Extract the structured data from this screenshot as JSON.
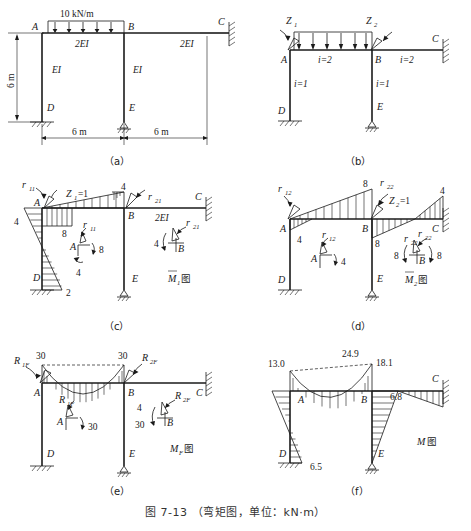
{
  "figure": {
    "caption": "图 7-13 （弯矩图，单位：kN·m）",
    "caption_number": "图 7-13",
    "caption_text": "（弯矩图，单位：kN·m）",
    "units": "kN·m"
  },
  "panels": [
    {
      "id": "a",
      "label": "（a）",
      "title": "",
      "joints": [
        "A",
        "B",
        "C",
        "D",
        "E"
      ],
      "load_label": "10 kN/m",
      "member_labels": [
        {
          "name": "AB",
          "text": "2EI"
        },
        {
          "name": "BC",
          "text": "2EI"
        },
        {
          "name": "AD",
          "text": "EI"
        },
        {
          "name": "BE",
          "text": "EI"
        }
      ],
      "dimensions": [
        {
          "name": "height-AD",
          "text": "6 m"
        },
        {
          "name": "span-AB",
          "text": "6 m"
        },
        {
          "name": "span-BC",
          "text": "6 m"
        }
      ]
    },
    {
      "id": "b",
      "label": "（b）",
      "title": "",
      "joints": [
        "A",
        "B",
        "C",
        "D",
        "E"
      ],
      "unknowns": [
        "Z",
        "Z"
      ],
      "unknown_1": "Z",
      "unknown_1_sub": "1",
      "unknown_2": "Z",
      "unknown_2_sub": "2",
      "stiffness_labels": [
        {
          "name": "AB",
          "text": "i=2"
        },
        {
          "name": "BC",
          "text": "i=2"
        },
        {
          "name": "AD",
          "text": "i=1"
        },
        {
          "name": "BE",
          "text": "i=1"
        }
      ]
    },
    {
      "id": "c",
      "label": "（c）",
      "title": "M",
      "title_sub": "1",
      "title_suffix": "图",
      "applied": "Z",
      "applied_sub": "1",
      "applied_value": "=1",
      "joints": [
        "A",
        "B",
        "C",
        "D",
        "E"
      ],
      "member_label": "2EI",
      "reactions": [
        {
          "name": "r11-top",
          "symbol": "r",
          "sub": "11"
        },
        {
          "name": "r21-top",
          "symbol": "r",
          "sub": "21"
        },
        {
          "name": "r11-fbd",
          "symbol": "r",
          "sub": "11"
        },
        {
          "name": "r21-fbd",
          "symbol": "r",
          "sub": "21"
        }
      ],
      "ordinates": [
        {
          "name": "A-left",
          "value": "4"
        },
        {
          "name": "A-right",
          "value": "4"
        },
        {
          "name": "AB-mid",
          "value": "8"
        },
        {
          "name": "B-top",
          "value": "4"
        },
        {
          "name": "D-bottom",
          "value": "2"
        }
      ],
      "fbd_A": {
        "joint": "A",
        "right": "8",
        "bottom": "4"
      },
      "fbd_B": {
        "joint": "B",
        "left": "4"
      }
    },
    {
      "id": "d",
      "label": "（d）",
      "title": "M",
      "title_sub": "2",
      "title_suffix": "图",
      "applied": "Z",
      "applied_sub": "2",
      "applied_value": "=1",
      "joints": [
        "A",
        "B",
        "C",
        "D",
        "E"
      ],
      "reactions": [
        {
          "name": "r12-top",
          "symbol": "r",
          "sub": "12"
        },
        {
          "name": "r22-top",
          "symbol": "r",
          "sub": "22"
        },
        {
          "name": "r12-fbd",
          "symbol": "r",
          "sub": "12"
        },
        {
          "name": "r22-fbd",
          "symbol": "r",
          "sub": "22"
        },
        {
          "name": "r22-span",
          "symbol": "r",
          "sub": "22"
        }
      ],
      "ordinates": [
        {
          "name": "B-top",
          "value": "8"
        },
        {
          "name": "C-top",
          "value": "4"
        },
        {
          "name": "A-below",
          "value": "4"
        },
        {
          "name": "B-below",
          "value": "8"
        }
      ],
      "fbd_A": {
        "joint": "A",
        "right": "4"
      },
      "fbd_B": {
        "joint": "B",
        "left": "8",
        "right": "8"
      }
    },
    {
      "id": "e",
      "label": "（e）",
      "title": "M",
      "title_sub": "F",
      "title_suffix": "图",
      "joints": [
        "A",
        "B",
        "C",
        "D",
        "E"
      ],
      "reactions": [
        {
          "name": "R1F-top",
          "symbol": "R",
          "sub": "1F"
        },
        {
          "name": "R2F-top",
          "symbol": "R",
          "sub": "2F"
        },
        {
          "name": "R1F-fbd",
          "symbol": "R",
          "sub": "1F"
        },
        {
          "name": "R2F-fbd",
          "symbol": "R",
          "sub": "2F"
        }
      ],
      "ordinates": [
        {
          "name": "A-top",
          "value": "30"
        },
        {
          "name": "B-top",
          "value": "30"
        }
      ],
      "fbd_A": {
        "joint": "A",
        "right": "30"
      },
      "fbd_B": {
        "joint": "B",
        "upper": "4",
        "lower": "30"
      }
    },
    {
      "id": "f",
      "label": "（f）",
      "title": "M",
      "title_suffix": "图",
      "joints": [
        "A",
        "B",
        "C",
        "D",
        "E"
      ],
      "ordinates": [
        {
          "name": "A-top",
          "value": "13.0"
        },
        {
          "name": "AB-mid",
          "value": "24.9"
        },
        {
          "name": "B-top",
          "value": "18.1"
        },
        {
          "name": "BC-right",
          "value": "6.8"
        },
        {
          "name": "D-bottom",
          "value": "6.5"
        }
      ]
    }
  ],
  "style": {
    "ink": "#1a1a1a",
    "paper": "#ffffff",
    "caption_color": "#333333"
  }
}
